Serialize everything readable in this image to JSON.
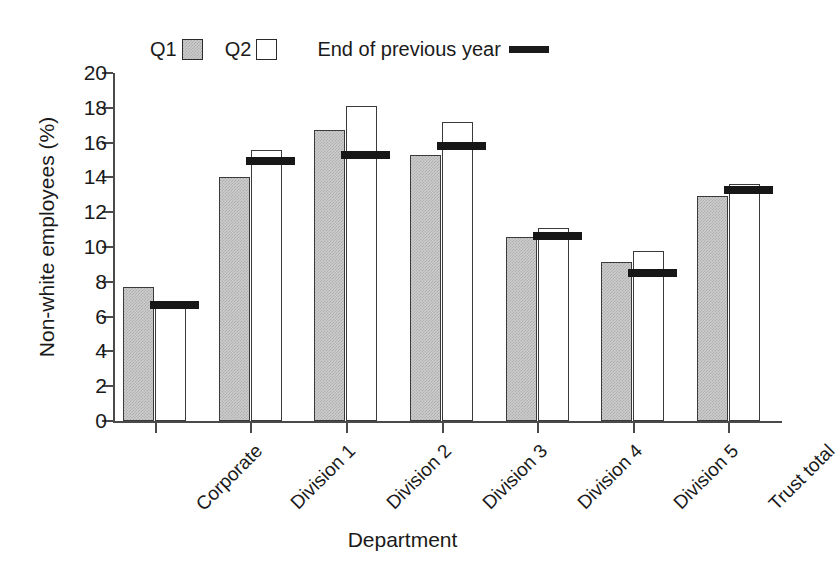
{
  "chart_data": {
    "type": "bar",
    "title": "",
    "subtitle": "",
    "xlabel": "Department",
    "ylabel": "Non-white employees (%)",
    "categories": [
      "Corporate",
      "Division 1",
      "Division 2",
      "Division 3",
      "Division 4",
      "Division 5",
      "Trust total"
    ],
    "series": [
      {
        "name": "Q1",
        "values": [
          7.7,
          14.05,
          16.7,
          15.3,
          10.55,
          9.15,
          12.95
        ],
        "style": "shaded-bar",
        "color": "#cdcdcd"
      },
      {
        "name": "Q2",
        "values": [
          6.85,
          15.6,
          18.1,
          17.2,
          11.1,
          9.75,
          13.65
        ],
        "style": "white-bar",
        "color": "#ffffff"
      },
      {
        "name": "End of previous year",
        "values": [
          6.65,
          14.95,
          15.3,
          15.8,
          10.65,
          8.5,
          13.3
        ],
        "style": "thick-line",
        "color": "#171717"
      }
    ],
    "ylim": [
      0,
      20
    ],
    "ytick_step": 2,
    "yticks": [
      "0",
      "2",
      "4",
      "6",
      "8",
      "10",
      "12",
      "14",
      "16",
      "18",
      "20"
    ],
    "grid": false,
    "legend_position": "top-center",
    "legend_entries": [
      "Q1",
      "Q2",
      "End of previous year"
    ]
  },
  "legend": {
    "q1_label": "Q1",
    "q2_label": "Q2",
    "refline_label": "End of previous year"
  },
  "axes": {
    "y_title": "Non-white employees (%)",
    "x_title": "Department"
  }
}
